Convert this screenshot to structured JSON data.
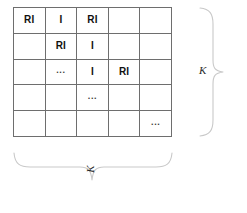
{
  "figure": {
    "name": "block-diagonal-matrix-diagram",
    "matrix": {
      "rows": 5,
      "cols": 5,
      "cells": [
        [
          "RI",
          "I",
          "RI",
          "",
          ""
        ],
        [
          "",
          "RI",
          "I",
          "",
          ""
        ],
        [
          "",
          "...",
          "I",
          "RI",
          ""
        ],
        [
          "",
          "",
          "...",
          "",
          ""
        ],
        [
          "",
          "",
          "",
          "",
          "..."
        ]
      ]
    },
    "annotations": {
      "right_brace_label": "K",
      "bottom_brace_label": "K",
      "right_brace_icon": "curly-brace-right-icon",
      "bottom_brace_icon": "curly-brace-bottom-icon"
    },
    "colors": {
      "grid_line": "#6e6e6e",
      "brace": "#c9c9c9",
      "text": "#111111",
      "background": "#ffffff"
    }
  }
}
